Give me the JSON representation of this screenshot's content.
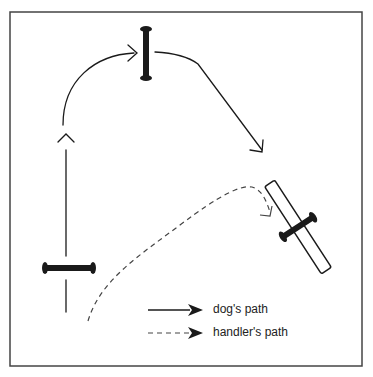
{
  "diagram": {
    "type": "agility-course-diagram",
    "frame": {
      "x": 10,
      "y": 12,
      "width": 352,
      "height": 354,
      "stroke": "#444444"
    },
    "colors": {
      "ink": "#1a1a1a",
      "dashed": "#444444",
      "background": "#ffffff"
    },
    "obstacles": [
      {
        "id": "jump-top",
        "kind": "bar-jump",
        "orientation": "vertical",
        "x": 146,
        "y1": 28,
        "y2": 78
      },
      {
        "id": "jump-left",
        "kind": "bar-jump",
        "orientation": "horizontal",
        "y": 268,
        "x1": 44,
        "x2": 93
      },
      {
        "id": "jump-right",
        "kind": "panel-jump-with-bar",
        "angle_deg": -33,
        "cx": 298,
        "cy": 227
      }
    ],
    "paths": {
      "dog": {
        "style": "solid",
        "description": "up left side, arc over top jump, diagonal down to right jump"
      },
      "handler": {
        "style": "dashed",
        "description": "from bottom-left curving up to right jump"
      }
    }
  },
  "legend": {
    "items": [
      {
        "style": "solid",
        "label": "dog's path"
      },
      {
        "style": "dashed",
        "label": "handler's path"
      }
    ]
  }
}
